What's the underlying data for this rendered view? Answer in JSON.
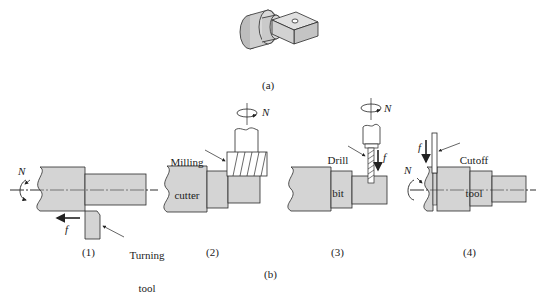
{
  "figure": {
    "part_caption": "(a)",
    "operations_caption": "(b)",
    "colors": {
      "part_fill": "#d4d4d4",
      "stroke": "#2a2a2a",
      "background": "#ffffff"
    }
  },
  "panels": [
    {
      "id": 1,
      "caption": "(1)",
      "tool_label_line1": "Turning",
      "tool_label_line2": "tool",
      "rotation_symbol": "N",
      "feed_symbol": "f"
    },
    {
      "id": 2,
      "caption": "(2)",
      "tool_label_line1": "Milling",
      "tool_label_line2": "cutter",
      "rotation_symbol": "N"
    },
    {
      "id": 3,
      "caption": "(3)",
      "tool_label_line1": "Drill",
      "tool_label_line2": "bit",
      "rotation_symbol": "N",
      "feed_symbol": "f"
    },
    {
      "id": 4,
      "caption": "(4)",
      "tool_label_line1": "Cutoff",
      "tool_label_line2": "tool",
      "rotation_symbol": "N",
      "feed_symbol": "f"
    }
  ]
}
